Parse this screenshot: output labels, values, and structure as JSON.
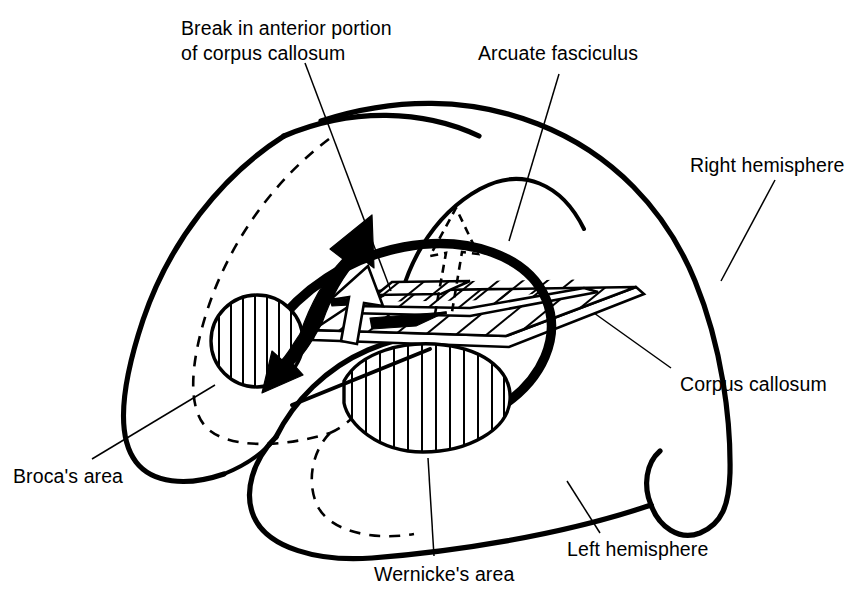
{
  "figure": {
    "kind": "anatomical-line-diagram",
    "background_color": "#ffffff",
    "ink_color": "#000000"
  },
  "labels": {
    "break_corpus_callosum": {
      "line1": "Break in anterior portion",
      "line2": "of corpus callosum"
    },
    "arcuate_fasciculus": "Arcuate fasciculus",
    "right_hemisphere": "Right hemisphere",
    "corpus_callosum": "Corpus callosum",
    "brocas_area": "Broca's area",
    "left_hemisphere": "Left hemisphere",
    "wernickes_area": "Wernicke's area"
  },
  "structures": [
    {
      "name": "right-hemisphere-outline",
      "style": "solid heavy outline",
      "description": "Large outer dome forming the posterior/right hemisphere shell"
    },
    {
      "name": "left-hemisphere-outline",
      "style": "solid heavy outline",
      "description": "Inner dome drawn in front, forming the left hemisphere"
    },
    {
      "name": "interior-dashed-curve",
      "style": "dashed medium",
      "description": "Hidden interior contour shown with a dashed line"
    },
    {
      "name": "corpus-callosum-slab",
      "style": "hatched parallelogram slab",
      "hatch": "diagonal",
      "description": "Flat plate representing the corpus callosum, cut away on the left"
    },
    {
      "name": "corpus-callosum-break",
      "style": "notch with solid black wedge",
      "description": "Gap in the anterior portion of the callosal slab"
    },
    {
      "name": "brocas-area-region",
      "style": "hatched circle",
      "hatch": "vertical",
      "description": "Circular region at the anterior inferior frontal lobe"
    },
    {
      "name": "wernickes-area-region",
      "style": "hatched lens",
      "hatch": "vertical",
      "description": "Lens-shaped region in the posterior superior temporal lobe"
    },
    {
      "name": "arcuate-fasciculus-tract",
      "style": "bold curved band",
      "description": "Thick arc connecting Broca's area to Wernicke's area"
    },
    {
      "name": "arcuate-fasciculus-thin-arc",
      "style": "thin arc",
      "description": "Slender arc rising toward the superior cortex"
    },
    {
      "name": "double-headed-arrow",
      "style": "solid black, two heads",
      "description": "Bold arrow between Broca's area and the callosal break"
    },
    {
      "name": "open-outline-arrow",
      "style": "white fill, black outline",
      "description": "Hollow arrow crossing the callosal slab"
    },
    {
      "name": "dashed-outline-arrow",
      "style": "dashed outline, pointing up",
      "description": "Interrupted transfer pathway through the corpus callosum"
    }
  ]
}
